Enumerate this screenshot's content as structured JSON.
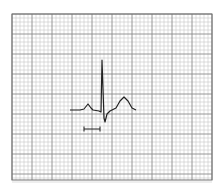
{
  "diagram": {
    "type": "ecg-strip",
    "grid": {
      "x": 12,
      "y": 14,
      "width": 200,
      "height": 166,
      "minor_spacing": 4,
      "major_every": 5,
      "minor_color": "#c8c8c8",
      "major_color": "#8a8a8a",
      "border_color": "#707070"
    },
    "waveform": {
      "color": "#222222",
      "labels": [
        "P wave",
        "QRS complex",
        "T wave"
      ],
      "points": [
        [
          70,
          110
        ],
        [
          80,
          110
        ],
        [
          84,
          109
        ],
        [
          88,
          104
        ],
        [
          91,
          108
        ],
        [
          93,
          110
        ],
        [
          99,
          111
        ],
        [
          101,
          112
        ],
        [
          102,
          60
        ],
        [
          104,
          118
        ],
        [
          105,
          122
        ],
        [
          107,
          114
        ],
        [
          110,
          111
        ],
        [
          116,
          108
        ],
        [
          120,
          101
        ],
        [
          124,
          97
        ],
        [
          128,
          101
        ],
        [
          132,
          108
        ],
        [
          136,
          110
        ]
      ]
    },
    "interval_marker": {
      "x1": 84,
      "x2": 100,
      "y": 129,
      "tick_height": 5,
      "label": "interval marker"
    }
  }
}
